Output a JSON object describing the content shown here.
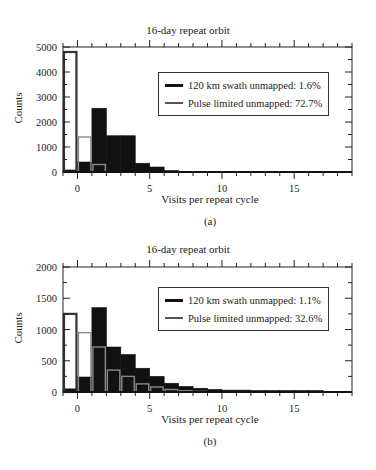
{
  "chart_data": [
    {
      "type": "bar",
      "panel_label": "(a)",
      "title": "16-day repeat orbit",
      "xlabel": "Visits per repeat cycle",
      "ylabel": "Counts",
      "xlim": [
        -1,
        19
      ],
      "ylim": [
        0,
        5000
      ],
      "yticks": [
        0,
        1000,
        2000,
        3000,
        4000,
        5000
      ],
      "xticks": [
        0,
        5,
        10,
        15
      ],
      "bin_edges": [
        -1,
        0,
        1,
        2,
        3,
        4,
        5,
        6,
        7,
        8
      ],
      "series": [
        {
          "name": "120 km swath unmapped: 1.6%",
          "style": "filled",
          "color": "#111111",
          "values": [
            80,
            400,
            2550,
            1450,
            1450,
            350,
            200,
            30,
            0
          ]
        },
        {
          "name": "Pulse limited unmapped: 72.7%",
          "style": "outline",
          "color": "#444444",
          "values": [
            4800,
            1400,
            300,
            0,
            0,
            0,
            0,
            0,
            0
          ]
        }
      ],
      "legend_position": "upper right",
      "grid": false
    },
    {
      "type": "bar",
      "panel_label": "(b)",
      "title": "16-day repeat orbit",
      "xlabel": "Visits per repeat cycle",
      "ylabel": "Counts",
      "xlim": [
        -1,
        19
      ],
      "ylim": [
        0,
        2000
      ],
      "yticks": [
        0,
        500,
        1000,
        1500,
        2000
      ],
      "xticks": [
        0,
        5,
        10,
        15
      ],
      "bin_edges": [
        -1,
        0,
        1,
        2,
        3,
        4,
        5,
        6,
        7,
        8,
        9,
        10,
        11,
        12,
        13,
        14,
        15,
        16,
        17,
        18
      ],
      "series": [
        {
          "name": "120 km swath unmapped: 1.1%",
          "style": "filled",
          "color": "#111111",
          "values": [
            50,
            240,
            1350,
            720,
            600,
            380,
            250,
            140,
            90,
            60,
            40,
            30,
            30,
            10,
            10,
            10,
            5,
            5,
            0
          ]
        },
        {
          "name": "Pulse limited unmapped: 32.6%",
          "style": "outline",
          "color": "#444444",
          "values": [
            1250,
            950,
            720,
            350,
            250,
            130,
            80,
            40,
            20,
            10,
            5,
            0,
            0,
            0,
            0,
            0,
            0,
            0,
            0
          ]
        }
      ],
      "legend_position": "upper right",
      "grid": false
    }
  ],
  "panels": [
    {
      "title": "16-day repeat orbit",
      "caption": "(a)",
      "xlabel": "Visits per repeat cycle",
      "ylabel": "Counts",
      "legend": [
        "120 km swath unmapped: 1.6%",
        "Pulse limited unmapped: 72.7%"
      ]
    },
    {
      "title": "16-day repeat orbit",
      "caption": "(b)",
      "xlabel": "Visits per repeat cycle",
      "ylabel": "Counts",
      "legend": [
        "120 km swath unmapped: 1.1%",
        "Pulse limited unmapped: 32.6%"
      ]
    }
  ]
}
